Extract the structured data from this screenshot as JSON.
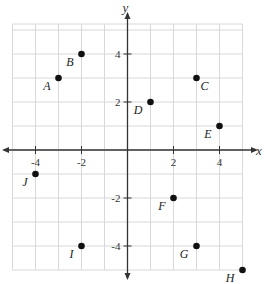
{
  "chart_data": {
    "type": "scatter",
    "title": "",
    "xlabel": "x",
    "ylabel": "y",
    "xlim": [
      -5,
      5
    ],
    "ylim": [
      -5,
      5
    ],
    "grid": true,
    "x_ticks": [
      -4,
      -2,
      2,
      4
    ],
    "y_ticks": [
      4,
      2,
      -2,
      -4
    ],
    "x_tick_labels": [
      "-4",
      "-2",
      "2",
      "4"
    ],
    "y_tick_labels": [
      "4",
      "2",
      "-2",
      "-4"
    ],
    "points": [
      {
        "label": "A",
        "x": -3,
        "y": 3,
        "label_pos": "bottom-left"
      },
      {
        "label": "B",
        "x": -2,
        "y": 4,
        "label_pos": "bottom-left"
      },
      {
        "label": "C",
        "x": 3,
        "y": 3,
        "label_pos": "bottom-right"
      },
      {
        "label": "D",
        "x": 1,
        "y": 2,
        "label_pos": "bottom-left"
      },
      {
        "label": "E",
        "x": 4,
        "y": 1,
        "label_pos": "bottom-left"
      },
      {
        "label": "F",
        "x": 2,
        "y": -2,
        "label_pos": "bottom-left"
      },
      {
        "label": "G",
        "x": 3,
        "y": -4,
        "label_pos": "bottom-left"
      },
      {
        "label": "H",
        "x": 5,
        "y": -5,
        "label_pos": "bottom-left"
      },
      {
        "label": "I",
        "x": -2,
        "y": -4,
        "label_pos": "bottom-left"
      },
      {
        "label": "J",
        "x": -4,
        "y": -1,
        "label_pos": "bottom-left"
      }
    ]
  }
}
